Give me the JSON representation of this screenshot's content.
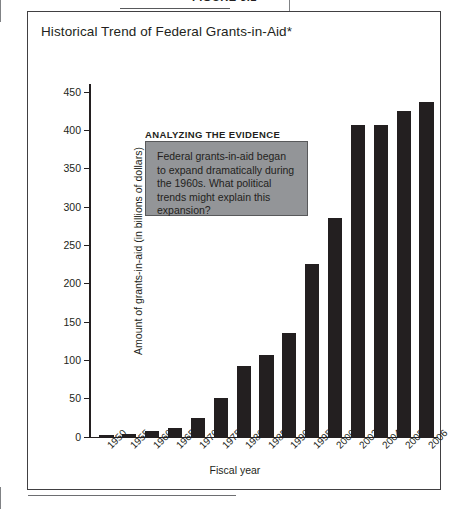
{
  "figure": {
    "label": "FIGURE 3.1",
    "title": "Historical Trend of Federal Grants-in-Aid*"
  },
  "annotation": {
    "heading": "ANALYZING THE EVIDENCE",
    "body": "Federal grants-in-aid began to expand dramatically during the 1960s. What political trends might explain this expansion?",
    "box_fill": "#939598",
    "box_border": "#58595b"
  },
  "chart_data": {
    "type": "bar",
    "title": "Historical Trend of Federal Grants-in-Aid*",
    "xlabel": "Fiscal year",
    "ylabel": "Amount of grants-in-aid (in billions of dollars)",
    "categories": [
      "1950",
      "1955",
      "1960",
      "1965",
      "1970",
      "1975",
      "1980",
      "1985",
      "1990",
      "1995",
      "2000",
      "2002",
      "2004",
      "2005",
      "2006"
    ],
    "values": [
      2.3,
      3.2,
      7.0,
      10.9,
      24.0,
      49.8,
      91.4,
      105.9,
      135.3,
      225.0,
      285.0,
      406.9,
      406.9,
      425.0,
      436.6
    ],
    "ylim": [
      0,
      460
    ],
    "yticks": [
      0,
      50,
      100,
      150,
      200,
      250,
      300,
      350,
      400,
      450
    ],
    "ytick_labels": [
      "0",
      "50",
      "100",
      "150",
      "200",
      "250",
      "300",
      "350",
      "400",
      "450"
    ],
    "grid": false,
    "legend": null,
    "bar_color": "#231f20"
  }
}
